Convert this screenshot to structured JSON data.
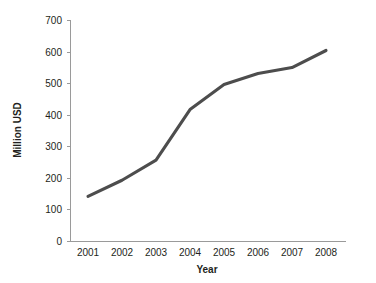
{
  "chart_data": {
    "type": "line",
    "title": "",
    "xlabel": "Year",
    "ylabel": "Million USD",
    "x": [
      2001,
      2002,
      2003,
      2004,
      2005,
      2006,
      2007,
      2008
    ],
    "categories": [
      "2001",
      "2002",
      "2003",
      "2004",
      "2005",
      "2006",
      "2007",
      "2008"
    ],
    "values": [
      143,
      194,
      258,
      418,
      497,
      532,
      551,
      605
    ],
    "series": [
      {
        "name": "Million USD",
        "values": [
          143,
          194,
          258,
          418,
          497,
          532,
          551,
          605
        ]
      }
    ],
    "xlim": [
      2001,
      2008
    ],
    "ylim": [
      0,
      700
    ],
    "ytick_labels": [
      "0",
      "100",
      "200",
      "300",
      "400",
      "500",
      "600",
      "700"
    ],
    "ytick_values": [
      0,
      100,
      200,
      300,
      400,
      500,
      600,
      700
    ],
    "xtick_labels": [
      "2001",
      "2002",
      "2003",
      "2004",
      "2005",
      "2006",
      "2007",
      "2008"
    ],
    "grid": false,
    "legend": false,
    "line_color": "#4d4d4d",
    "axis_color": "#9a9a9a",
    "text_color": "#231f20"
  },
  "axes": {
    "y_title": "Million USD",
    "x_title": "Year",
    "y_ticks": [
      {
        "label": "700",
        "value": 700
      },
      {
        "label": "600",
        "value": 600
      },
      {
        "label": "500",
        "value": 500
      },
      {
        "label": "400",
        "value": 400
      },
      {
        "label": "300",
        "value": 300
      },
      {
        "label": "200",
        "value": 200
      },
      {
        "label": "100",
        "value": 100
      },
      {
        "label": "0",
        "value": 0
      }
    ],
    "x_ticks": [
      {
        "label": "2001"
      },
      {
        "label": "2002"
      },
      {
        "label": "2003"
      },
      {
        "label": "2004"
      },
      {
        "label": "2005"
      },
      {
        "label": "2006"
      },
      {
        "label": "2007"
      },
      {
        "label": "2008"
      }
    ]
  }
}
